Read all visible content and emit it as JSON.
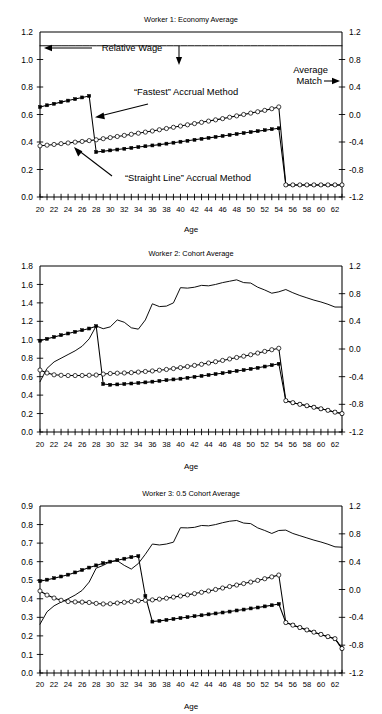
{
  "figure": {
    "panel_count": 3,
    "x_axis_label": "Age",
    "x_ticks": [
      "20",
      "22",
      "24",
      "26",
      "28",
      "30",
      "32",
      "34",
      "36",
      "38",
      "40",
      "42",
      "44",
      "46",
      "48",
      "50",
      "52",
      "54",
      "56",
      "58",
      "60",
      "62"
    ],
    "x_range": [
      20,
      63
    ],
    "right_axis_ticks": [
      "1.2",
      "0.8",
      "0.4",
      "0.0",
      "-0.4",
      "-0.8",
      "-1.2"
    ],
    "right_axis_range": [
      -1.2,
      1.2
    ],
    "line_color": "#000000"
  },
  "annotations": {
    "relative_wage": "Relative Wage",
    "relative_wage_arrow_left": "←",
    "relative_wage_arrow_down": "↓",
    "average_match_line1": "Average",
    "average_match_line2": "Match",
    "average_match_arrow_right": "→",
    "fastest_method": "“Fastest” Accrual Method",
    "straight_line_method": "“Straight Line” Accrual Method"
  },
  "chart_data": [
    {
      "type": "line",
      "title": "Worker 1: Economy Average",
      "xlabel": "Age",
      "ylabel": "",
      "x": [
        20,
        21,
        22,
        23,
        24,
        25,
        26,
        27,
        28,
        29,
        30,
        31,
        32,
        33,
        34,
        35,
        36,
        37,
        38,
        39,
        40,
        41,
        42,
        43,
        44,
        45,
        46,
        47,
        48,
        49,
        50,
        51,
        52,
        53,
        54,
        55,
        56,
        57,
        58,
        59,
        60,
        61,
        62,
        63
      ],
      "ylim": [
        0.0,
        1.2
      ],
      "ytick_labels": [
        "0.0",
        "0.2",
        "0.4",
        "0.6",
        "0.8",
        "1.0",
        "1.2"
      ],
      "ylim_right": [
        -1.2,
        1.2
      ],
      "ytick_labels_right": [
        "-1.2",
        "-0.8",
        "-0.4",
        "0.0",
        "0.4",
        "0.8",
        "1.2"
      ],
      "grid": false,
      "legend": "none",
      "series": [
        {
          "name": "Average Match",
          "axis": "right",
          "marker": "none",
          "values": [
            1.0,
            1.0,
            1.0,
            1.0,
            1.0,
            1.0,
            1.0,
            1.0,
            1.0,
            1.0,
            1.0,
            1.0,
            1.0,
            1.0,
            1.0,
            1.0,
            1.0,
            1.0,
            1.0,
            1.0,
            1.0,
            1.0,
            1.0,
            1.0,
            1.0,
            1.0,
            1.0,
            1.0,
            1.0,
            1.0,
            1.0,
            1.0,
            1.0,
            1.0,
            1.0,
            1.0,
            1.0,
            1.0,
            1.0,
            1.0,
            1.0,
            1.0,
            1.0,
            1.0
          ]
        },
        {
          "name": "“Fastest” Accrual Method",
          "axis": "left",
          "marker": "filled",
          "values": [
            0.655,
            0.667,
            0.678,
            0.69,
            0.701,
            0.712,
            0.724,
            0.735,
            0.327,
            0.333,
            0.339,
            0.345,
            0.351,
            0.357,
            0.363,
            0.369,
            0.375,
            0.381,
            0.388,
            0.395,
            0.402,
            0.409,
            0.416,
            0.423,
            0.43,
            0.437,
            0.444,
            0.451,
            0.458,
            0.465,
            0.472,
            0.479,
            0.486,
            0.493,
            0.5,
            0.088,
            0.088,
            0.088,
            0.088,
            0.088,
            0.088,
            0.088,
            0.088,
            0.088
          ]
        },
        {
          "name": "“Straight Line” Accrual Method",
          "axis": "left",
          "marker": "open",
          "values": [
            0.372,
            0.377,
            0.382,
            0.388,
            0.393,
            0.399,
            0.404,
            0.41,
            0.416,
            0.424,
            0.432,
            0.44,
            0.448,
            0.456,
            0.464,
            0.472,
            0.48,
            0.489,
            0.498,
            0.507,
            0.516,
            0.525,
            0.534,
            0.543,
            0.552,
            0.561,
            0.57,
            0.58,
            0.59,
            0.6,
            0.61,
            0.62,
            0.63,
            0.642,
            0.655,
            0.088,
            0.088,
            0.088,
            0.088,
            0.088,
            0.088,
            0.088,
            0.088,
            0.088
          ]
        }
      ]
    },
    {
      "type": "line",
      "title": "Worker 2: Cohort Average",
      "xlabel": "Age",
      "ylabel": "",
      "x": [
        20,
        21,
        22,
        23,
        24,
        25,
        26,
        27,
        28,
        29,
        30,
        31,
        32,
        33,
        34,
        35,
        36,
        37,
        38,
        39,
        40,
        41,
        42,
        43,
        44,
        45,
        46,
        47,
        48,
        49,
        50,
        51,
        52,
        53,
        54,
        55,
        56,
        57,
        58,
        59,
        60,
        61,
        62,
        63
      ],
      "ylim": [
        0.0,
        1.8
      ],
      "ytick_labels": [
        "0.0",
        "0.2",
        "0.4",
        "0.6",
        "0.8",
        "1.0",
        "1.2",
        "1.4",
        "1.6",
        "1.8"
      ],
      "ylim_right": [
        -1.2,
        1.2
      ],
      "ytick_labels_right": [
        "-1.2",
        "-0.8",
        "-0.4",
        "0.0",
        "0.4",
        "0.8",
        "1.2"
      ],
      "grid": false,
      "legend": "none",
      "series": [
        {
          "name": "Relative Wage",
          "axis": "left",
          "marker": "none",
          "values": [
            0.545,
            0.69,
            0.76,
            0.8,
            0.84,
            0.88,
            0.93,
            1.01,
            1.15,
            1.12,
            1.14,
            1.215,
            1.19,
            1.13,
            1.115,
            1.215,
            1.39,
            1.36,
            1.365,
            1.4,
            1.565,
            1.56,
            1.57,
            1.59,
            1.585,
            1.6,
            1.62,
            1.635,
            1.65,
            1.62,
            1.615,
            1.57,
            1.54,
            1.505,
            1.52,
            1.545,
            1.51,
            1.48,
            1.455,
            1.43,
            1.41,
            1.385,
            1.355,
            1.355
          ]
        },
        {
          "name": "“Fastest” Accrual Method",
          "axis": "left",
          "marker": "filled",
          "values": [
            0.99,
            1.01,
            1.03,
            1.05,
            1.068,
            1.086,
            1.104,
            1.122,
            1.148,
            0.52,
            0.512,
            0.516,
            0.52,
            0.526,
            0.532,
            0.538,
            0.546,
            0.554,
            0.562,
            0.57,
            0.578,
            0.588,
            0.598,
            0.608,
            0.618,
            0.628,
            0.638,
            0.65,
            0.662,
            0.672,
            0.684,
            0.696,
            0.71,
            0.724,
            0.74,
            0.34,
            0.318,
            0.3,
            0.285,
            0.268,
            0.252,
            0.235,
            0.215,
            0.2
          ]
        },
        {
          "name": "“Straight Line” Accrual Method",
          "axis": "left",
          "marker": "open",
          "values": [
            0.672,
            0.64,
            0.62,
            0.615,
            0.612,
            0.612,
            0.613,
            0.615,
            0.618,
            0.628,
            0.634,
            0.638,
            0.64,
            0.644,
            0.65,
            0.656,
            0.662,
            0.67,
            0.678,
            0.688,
            0.698,
            0.71,
            0.722,
            0.734,
            0.748,
            0.762,
            0.776,
            0.792,
            0.808,
            0.822,
            0.838,
            0.856,
            0.874,
            0.892,
            0.908,
            0.34,
            0.318,
            0.3,
            0.285,
            0.268,
            0.252,
            0.235,
            0.215,
            0.2
          ]
        }
      ]
    },
    {
      "type": "line",
      "title": "Worker 3: 0.5 Cohort Average",
      "xlabel": "Age",
      "ylabel": "",
      "x": [
        20,
        21,
        22,
        23,
        24,
        25,
        26,
        27,
        28,
        29,
        30,
        31,
        32,
        33,
        34,
        35,
        36,
        37,
        38,
        39,
        40,
        41,
        42,
        43,
        44,
        45,
        46,
        47,
        48,
        49,
        50,
        51,
        52,
        53,
        54,
        55,
        56,
        57,
        58,
        59,
        60,
        61,
        62,
        63
      ],
      "ylim": [
        0.0,
        0.9
      ],
      "ytick_labels": [
        "0.0",
        "0.1",
        "0.2",
        "0.3",
        "0.4",
        "0.5",
        "0.6",
        "0.7",
        "0.8",
        "0.9"
      ],
      "ylim_right": [
        -1.2,
        1.2
      ],
      "ytick_labels_right": [
        "-1.2",
        "-0.8",
        "-0.4",
        "0.0",
        "0.4",
        "0.8",
        "1.2"
      ],
      "grid": false,
      "legend": "none",
      "series": [
        {
          "name": "Relative Wage",
          "axis": "left",
          "marker": "none",
          "values": [
            0.263,
            0.33,
            0.362,
            0.382,
            0.4,
            0.42,
            0.445,
            0.49,
            0.565,
            0.58,
            0.6,
            0.605,
            0.58,
            0.56,
            0.59,
            0.64,
            0.695,
            0.69,
            0.695,
            0.705,
            0.783,
            0.782,
            0.785,
            0.795,
            0.793,
            0.8,
            0.81,
            0.818,
            0.822,
            0.808,
            0.805,
            0.782,
            0.768,
            0.752,
            0.768,
            0.77,
            0.752,
            0.74,
            0.728,
            0.716,
            0.706,
            0.694,
            0.68,
            0.678
          ]
        },
        {
          "name": "“Fastest” Accrual Method",
          "axis": "left",
          "marker": "filled",
          "values": [
            0.495,
            0.503,
            0.511,
            0.52,
            0.53,
            0.542,
            0.555,
            0.568,
            0.58,
            0.592,
            0.6,
            0.608,
            0.616,
            0.624,
            0.63,
            0.415,
            0.277,
            0.281,
            0.286,
            0.291,
            0.296,
            0.301,
            0.306,
            0.311,
            0.316,
            0.321,
            0.326,
            0.331,
            0.337,
            0.342,
            0.348,
            0.353,
            0.359,
            0.365,
            0.372,
            0.272,
            0.258,
            0.245,
            0.232,
            0.22,
            0.208,
            0.196,
            0.185,
            0.132
          ]
        },
        {
          "name": "“Straight Line” Accrual Method",
          "axis": "left",
          "marker": "open",
          "values": [
            0.442,
            0.42,
            0.404,
            0.392,
            0.385,
            0.383,
            0.382,
            0.38,
            0.375,
            0.372,
            0.373,
            0.377,
            0.381,
            0.385,
            0.389,
            0.392,
            0.394,
            0.398,
            0.403,
            0.409,
            0.415,
            0.421,
            0.428,
            0.435,
            0.442,
            0.45,
            0.458,
            0.466,
            0.474,
            0.482,
            0.49,
            0.499,
            0.508,
            0.518,
            0.528,
            0.272,
            0.258,
            0.245,
            0.232,
            0.22,
            0.208,
            0.196,
            0.185,
            0.132
          ]
        }
      ]
    }
  ]
}
